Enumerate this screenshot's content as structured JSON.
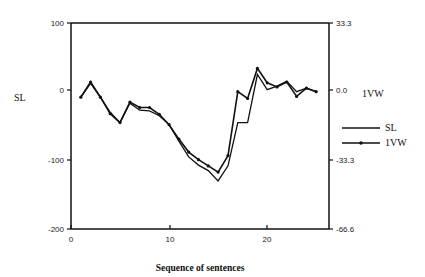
{
  "chart_data": {
    "type": "line",
    "title": "",
    "xlabel": "Sequence  of  sentences",
    "ylabel": "SL",
    "y2label": "1VW",
    "xlim": [
      0,
      26
    ],
    "ylim": [
      -200,
      100
    ],
    "y2lim": [
      -66.6,
      33.3
    ],
    "x_ticks": [
      0,
      10,
      20
    ],
    "y_ticks": [
      100,
      0,
      -100,
      -200
    ],
    "y2_ticks": [
      "33.3",
      "0.0",
      "-33.3",
      "-66.6"
    ],
    "grid": false,
    "legend_position": "right",
    "x": [
      1,
      2,
      3,
      4,
      5,
      6,
      7,
      8,
      9,
      10,
      11,
      12,
      13,
      14,
      15,
      16,
      17,
      18,
      19,
      20,
      21,
      22,
      23,
      24,
      25
    ],
    "series": [
      {
        "name": "SL",
        "axis": "left",
        "marker": "none",
        "values": [
          -8,
          12,
          -8,
          -30,
          -45,
          -17,
          -27,
          -28,
          -35,
          -48,
          -72,
          -95,
          -107,
          -115,
          -130,
          -108,
          -45,
          -45,
          25,
          3,
          8,
          15,
          0,
          5,
          0
        ]
      },
      {
        "name": "1VW",
        "axis": "right",
        "marker": "dot",
        "values": [
          -2.7,
          4.7,
          -2.7,
          -10.7,
          -15,
          -5,
          -7.7,
          -7.7,
          -11,
          -16,
          -23,
          -29.3,
          -33,
          -36,
          -39,
          -31,
          0,
          -3.3,
          11.3,
          4.3,
          2.3,
          4.7,
          -2.3,
          1.7,
          0
        ]
      }
    ]
  },
  "labels": {
    "left_axis_title": "SL",
    "right_axis_title": "1VW",
    "x_axis_title": "Sequence  of  sentences",
    "x_tick_0": "0",
    "x_tick_10": "10",
    "x_tick_20": "20",
    "y_tick_100": "100",
    "y_tick_0": "0",
    "y_tick_m100": "-100",
    "y_tick_m200": "-200",
    "y2_tick_top": "33.3",
    "y2_tick_zero": "0.0",
    "y2_tick_m33": "-33.3",
    "y2_tick_m66": "-66.6",
    "legend_sl": "SL",
    "legend_1vw": "1VW"
  }
}
